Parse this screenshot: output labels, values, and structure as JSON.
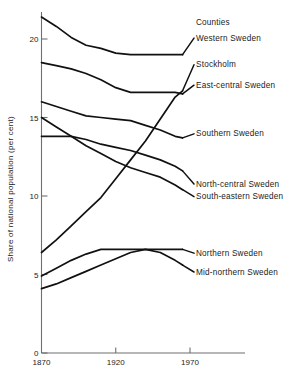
{
  "chart_data": {
    "type": "line",
    "title": "",
    "subtitle": "",
    "xlabel": "",
    "ylabel": "Share of national population (per cent)",
    "legend_heading": "Counties",
    "legend_position": "right-inline",
    "grid": false,
    "x": [
      1870,
      1880,
      1890,
      1900,
      1910,
      1920,
      1930,
      1940,
      1950,
      1960,
      1965
    ],
    "xlim": [
      1865,
      1978
    ],
    "ylim": [
      0,
      22
    ],
    "xticks": [
      1870,
      1920,
      1970
    ],
    "xtick_labels": [
      "1870",
      "1920",
      "1970"
    ],
    "yticks": [
      0,
      5,
      10,
      15,
      20
    ],
    "ytick_labels": [
      "0",
      "5",
      "10",
      "15",
      "20"
    ],
    "series": [
      {
        "name": "Western Sweden",
        "values": [
          21.4,
          20.8,
          20.1,
          19.6,
          19.4,
          19.1,
          19.0,
          19.0,
          19.0,
          19.0,
          19.0
        ],
        "label_x": 1990,
        "label_y": 19.9
      },
      {
        "name": "Stockholm",
        "values": [
          6.4,
          7.2,
          8.1,
          9.0,
          9.9,
          11.1,
          12.3,
          13.5,
          14.9,
          16.3,
          16.7
        ],
        "label_x": 1990,
        "label_y": 18.2
      },
      {
        "name": "East-central Sweden",
        "values": [
          18.5,
          18.3,
          18.1,
          17.8,
          17.4,
          16.9,
          16.6,
          16.6,
          16.6,
          16.6,
          16.5
        ],
        "label_x": 1990,
        "label_y": 16.9
      },
      {
        "name": "Southern Sweden",
        "values": [
          16.0,
          15.7,
          15.4,
          15.1,
          15.0,
          14.9,
          14.8,
          14.5,
          14.2,
          13.8,
          13.7
        ],
        "label_x": 1990,
        "label_y": 13.8
      },
      {
        "name": "North-central Sweden",
        "values": [
          13.8,
          13.8,
          13.8,
          13.6,
          13.3,
          13.1,
          12.9,
          12.6,
          12.3,
          11.9,
          11.6
        ],
        "label_x": 1990,
        "label_y": 10.6
      },
      {
        "name": "South-eastern Sweden",
        "values": [
          15.0,
          14.4,
          13.8,
          13.2,
          12.7,
          12.2,
          11.8,
          11.5,
          11.2,
          10.7,
          10.4
        ],
        "label_x": 1990,
        "label_y": 9.8
      },
      {
        "name": "Northern Sweden",
        "values": [
          4.9,
          5.4,
          5.9,
          6.3,
          6.6,
          6.6,
          6.6,
          6.6,
          6.6,
          6.6,
          6.6
        ],
        "label_x": 1990,
        "label_y": 6.2
      },
      {
        "name": "Mid-northern Sweden",
        "values": [
          4.1,
          4.4,
          4.8,
          5.2,
          5.6,
          6.0,
          6.4,
          6.6,
          6.4,
          5.9,
          5.6
        ],
        "label_x": 1990,
        "label_y": 5.0
      }
    ]
  }
}
